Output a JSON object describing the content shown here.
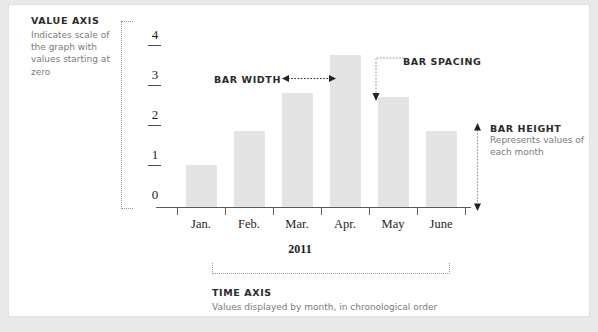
{
  "annotations": {
    "value_axis": {
      "title": "VALUE AXIS",
      "body": "Indicates scale of the graph with values starting at zero"
    },
    "bar_width": {
      "title": "BAR WIDTH"
    },
    "bar_spacing": {
      "title": "BAR SPACING"
    },
    "bar_height": {
      "title": "BAR HEIGHT",
      "body": "Represents values of each month"
    },
    "time_axis": {
      "title": "TIME AXIS",
      "body": "Values displayed by month, in chronological order"
    }
  },
  "chart_data": {
    "type": "bar",
    "title": "",
    "xlabel": "2011",
    "ylabel": "",
    "categories": [
      "Jan.",
      "Feb.",
      "Mar.",
      "Apr.",
      "May",
      "June"
    ],
    "values": [
      1.05,
      1.9,
      2.85,
      3.8,
      2.75,
      1.9
    ],
    "ytick_labels": [
      "4",
      "3",
      "2",
      "1",
      "0"
    ],
    "ytick_values": [
      4,
      3,
      2,
      1,
      0
    ],
    "ylim": [
      0,
      4.4
    ],
    "grid": false,
    "legend": null,
    "bar_color": "#e4e4e4",
    "axis_color": "#5a5a5a"
  },
  "colors": {
    "page_background": "#e9e9e9",
    "card_background": "#ffffff",
    "card_border": "#e2e2e2",
    "heading_text": "#2b2b2b",
    "body_text": "#7b7b7b",
    "dotted_guide": "#9a9a9a"
  }
}
